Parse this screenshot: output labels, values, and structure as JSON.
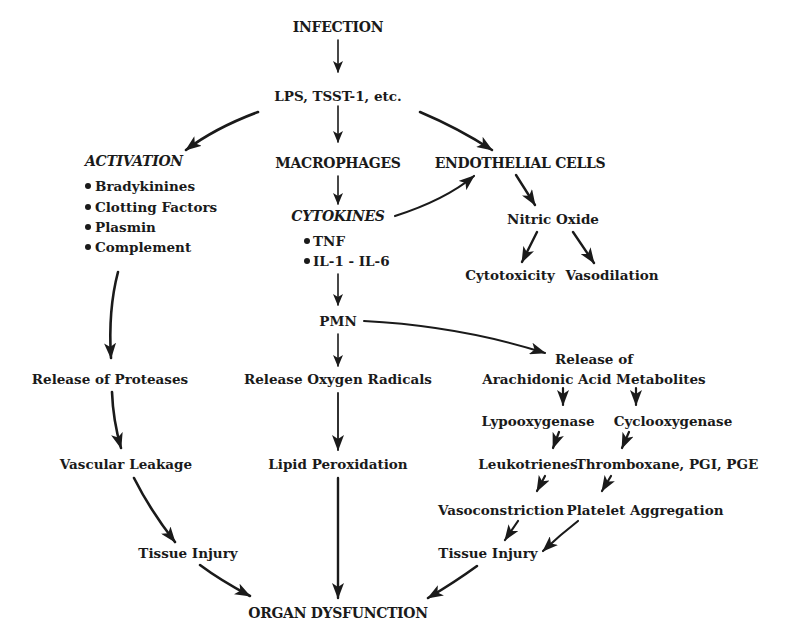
{
  "diagram": {
    "nodes": {
      "infection": "INFECTION",
      "lps": "LPS, TSST-1, etc.",
      "activation": "ACTIVATION",
      "activation_items": [
        "Bradykinines",
        "Clotting Factors",
        "Plasmin",
        "Complement"
      ],
      "macrophages": "MACROPHAGES",
      "endothelial": "ENDOTHELIAL CELLS",
      "cytokines": "CYTOKINES",
      "cytokine_items": [
        "TNF",
        "IL-1 - IL-6"
      ],
      "nitric_oxide": "Nitric Oxide",
      "cytotoxicity": "Cytotoxicity",
      "vasodilation": "Vasodilation",
      "pmn": "PMN",
      "release_proteases": "Release of Proteases",
      "release_oxygen": "Release Oxygen Radicals",
      "release_arachidonic_1": "Release of",
      "release_arachidonic_2": "Arachidonic Acid Metabolites",
      "lypooxygenase": "Lypooxygenase",
      "cyclooxygenase": "Cyclooxygenase",
      "leukotrienes": "Leukotrienes",
      "thromboxane": "Thromboxane, PGI, PGE",
      "vasoconstriction": "Vasoconstriction",
      "platelet_aggregation": "Platelet Aggregation",
      "vascular_leakage": "Vascular Leakage",
      "lipid_peroxidation": "Lipid Peroxidation",
      "tissue_injury_left": "Tissue Injury",
      "tissue_injury_right": "Tissue Injury",
      "organ_dysfunction": "ORGAN DYSFUNCTION"
    },
    "edges": [
      {
        "from": "infection",
        "to": "lps"
      },
      {
        "from": "lps",
        "to": "activation"
      },
      {
        "from": "lps",
        "to": "macrophages"
      },
      {
        "from": "lps",
        "to": "endothelial"
      },
      {
        "from": "macrophages",
        "to": "cytokines"
      },
      {
        "from": "cytokines",
        "to": "endothelial"
      },
      {
        "from": "endothelial",
        "to": "nitric_oxide"
      },
      {
        "from": "nitric_oxide",
        "to": "cytotoxicity"
      },
      {
        "from": "nitric_oxide",
        "to": "vasodilation"
      },
      {
        "from": "cytokines",
        "to": "pmn"
      },
      {
        "from": "activation",
        "to": "release_proteases"
      },
      {
        "from": "pmn",
        "to": "release_oxygen"
      },
      {
        "from": "pmn",
        "to": "release_arachidonic"
      },
      {
        "from": "release_arachidonic",
        "to": "lypooxygenase"
      },
      {
        "from": "release_arachidonic",
        "to": "cyclooxygenase"
      },
      {
        "from": "lypooxygenase",
        "to": "leukotrienes"
      },
      {
        "from": "cyclooxygenase",
        "to": "thromboxane"
      },
      {
        "from": "leukotrienes",
        "to": "vasoconstriction"
      },
      {
        "from": "thromboxane",
        "to": "platelet_aggregation"
      },
      {
        "from": "vasoconstriction",
        "to": "tissue_injury_right"
      },
      {
        "from": "platelet_aggregation",
        "to": "tissue_injury_right"
      },
      {
        "from": "release_proteases",
        "to": "vascular_leakage"
      },
      {
        "from": "vascular_leakage",
        "to": "tissue_injury_left"
      },
      {
        "from": "release_oxygen",
        "to": "lipid_peroxidation"
      },
      {
        "from": "tissue_injury_left",
        "to": "organ_dysfunction"
      },
      {
        "from": "lipid_peroxidation",
        "to": "organ_dysfunction"
      },
      {
        "from": "tissue_injury_right",
        "to": "organ_dysfunction"
      }
    ]
  }
}
